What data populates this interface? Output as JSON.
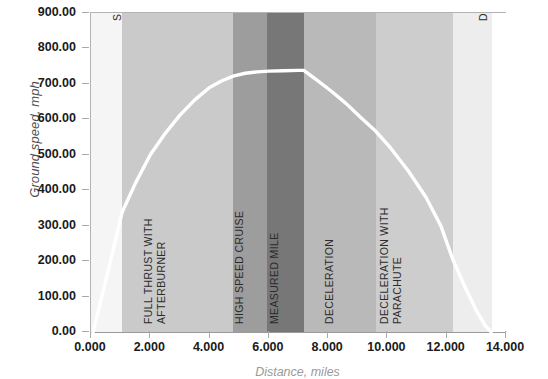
{
  "chart_data": {
    "type": "line",
    "title": "",
    "xlabel": "Distance, miles",
    "ylabel": "Ground speed, mph",
    "xlim": [
      0,
      14
    ],
    "ylim": [
      0,
      900
    ],
    "grid": false,
    "legend": "none",
    "x_ticks": [
      "0.000",
      "2.000",
      "4.000",
      "6.000",
      "8.000",
      "10.000",
      "12.000",
      "14.000"
    ],
    "x_tick_values": [
      0,
      2,
      4,
      6,
      8,
      10,
      12,
      14
    ],
    "y_ticks": [
      "0.00",
      "100.00",
      "200.00",
      "300.00",
      "400.00",
      "500.00",
      "600.00",
      "700.00",
      "800.00",
      "900.00"
    ],
    "y_tick_values": [
      0,
      100,
      200,
      300,
      400,
      500,
      600,
      700,
      800,
      900
    ],
    "series": [
      {
        "name": "Ground speed",
        "color": "#ffffff",
        "x": [
          0.07,
          0.35,
          0.7,
          1.05,
          1.5,
          2.0,
          2.5,
          3.0,
          3.5,
          4.0,
          4.4,
          4.8,
          5.2,
          5.6,
          6.0,
          6.5,
          7.0,
          7.18,
          7.6,
          8.1,
          8.6,
          9.1,
          9.6,
          10.1,
          10.7,
          11.3,
          11.8,
          12.2,
          12.6,
          13.0,
          13.3,
          13.5
        ],
        "y": [
          0,
          95,
          215,
          338,
          420,
          500,
          560,
          612,
          655,
          690,
          708,
          722,
          730,
          734,
          736,
          737,
          738,
          738,
          712,
          680,
          645,
          605,
          567,
          520,
          455,
          380,
          300,
          206,
          130,
          60,
          18,
          0
        ]
      }
    ],
    "bands": [
      {
        "label": "SLOW ACCELERATION",
        "x_start": 0.0,
        "x_end": 1.04,
        "color": "#f5f5f5",
        "label_lines": [
          "SLOW ACCELERATION"
        ],
        "label_align": "top"
      },
      {
        "label": "FULL THRUST WITH AFTERBURNER",
        "x_start": 1.04,
        "x_end": 4.8,
        "color": "#cacaca",
        "label_lines": [
          "FULL THRUST WITH",
          "AFTERBURNER"
        ],
        "label_align": "bottom"
      },
      {
        "label": "HIGH SPEED CRUISE",
        "x_start": 4.8,
        "x_end": 5.93,
        "color": "#9d9d9d",
        "label_lines": [
          "HIGH SPEED CRUISE"
        ],
        "label_align": "bottom"
      },
      {
        "label": "MEASURED MILE",
        "x_start": 5.93,
        "x_end": 7.18,
        "color": "#777777",
        "label_lines": [
          "MEASURED MILE"
        ],
        "label_align": "bottom"
      },
      {
        "label": "DECELERATION",
        "x_start": 7.18,
        "x_end": 9.6,
        "color": "#b9b9b9",
        "label_lines": [
          "DECELERATION"
        ],
        "label_align": "bottom"
      },
      {
        "label": "DECELERATION WITH PARACHUTE",
        "x_start": 9.6,
        "x_end": 12.2,
        "color": "#cdcdcd",
        "label_lines": [
          "DECELERATION WITH",
          "PARACHUTE"
        ],
        "label_align": "bottom"
      },
      {
        "label": "DECELERATION WITH BRAKING",
        "x_start": 12.2,
        "x_end": 13.52,
        "color": "#ededed",
        "label_lines": [
          "DECELERATION WITH BRAKING"
        ],
        "label_align": "top"
      }
    ],
    "line_color": "#ffffff",
    "axis_color": "#b3b3b3",
    "tick_label_color": "#1a1a1a",
    "band_label_color": "#2b2b2b"
  }
}
